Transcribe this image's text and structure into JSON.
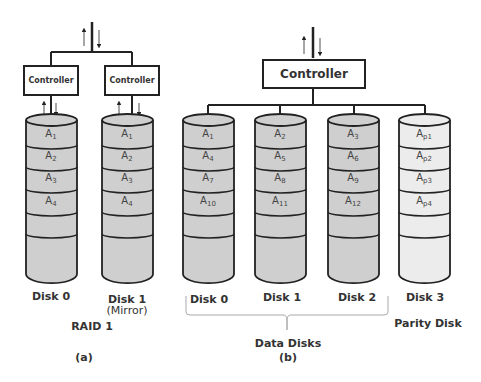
{
  "colors": {
    "data_disk_fill": "#cfcfcf",
    "parity_disk_fill": "#ececec",
    "stroke": "#222222",
    "text": "#333333"
  },
  "panel_a": {
    "controllers": [
      {
        "label": "Controller"
      },
      {
        "label": "Controller"
      }
    ],
    "disks": [
      {
        "name": "Disk 0",
        "sub_label": "",
        "blocks": [
          {
            "base": "A",
            "sub": "1"
          },
          {
            "base": "A",
            "sub": "2"
          },
          {
            "base": "A",
            "sub": "3"
          },
          {
            "base": "A",
            "sub": "4"
          }
        ]
      },
      {
        "name": "Disk 1",
        "sub_label": "(Mirror)",
        "blocks": [
          {
            "base": "A",
            "sub": "1"
          },
          {
            "base": "A",
            "sub": "2"
          },
          {
            "base": "A",
            "sub": "3"
          },
          {
            "base": "A",
            "sub": "4"
          }
        ]
      }
    ],
    "title": "RAID 1",
    "caption": "(a)"
  },
  "panel_b": {
    "controller": {
      "label": "Controller"
    },
    "disks": [
      {
        "name": "Disk 0",
        "blocks": [
          {
            "base": "A",
            "sub": "1"
          },
          {
            "base": "A",
            "sub": "4"
          },
          {
            "base": "A",
            "sub": "7"
          },
          {
            "base": "A",
            "sub": "10"
          }
        ]
      },
      {
        "name": "Disk 1",
        "blocks": [
          {
            "base": "A",
            "sub": "2"
          },
          {
            "base": "A",
            "sub": "5"
          },
          {
            "base": "A",
            "sub": "8"
          },
          {
            "base": "A",
            "sub": "11"
          }
        ]
      },
      {
        "name": "Disk 2",
        "blocks": [
          {
            "base": "A",
            "sub": "3"
          },
          {
            "base": "A",
            "sub": "6"
          },
          {
            "base": "A",
            "sub": "9"
          },
          {
            "base": "A",
            "sub": "12"
          }
        ]
      },
      {
        "name": "Disk 3",
        "blocks": [
          {
            "base": "A",
            "sub": "p1"
          },
          {
            "base": "A",
            "sub": "p2"
          },
          {
            "base": "A",
            "sub": "p3"
          },
          {
            "base": "A",
            "sub": "p4"
          }
        ]
      }
    ],
    "group_label": "Data Disks",
    "parity_label": "Parity Disk",
    "caption": "(b)"
  }
}
